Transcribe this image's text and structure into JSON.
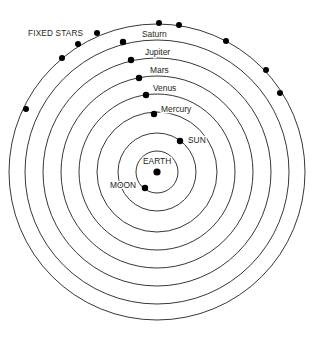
{
  "figure": {
    "background_color": "#ffffff",
    "line_color": "#231f20",
    "dot_color": "#000000",
    "text_color": "#231f20",
    "center": {
      "x": 157,
      "y": 172
    }
  },
  "annotations": {
    "fixed_stars": {
      "label": "FIXED STARS",
      "x": 28,
      "y": 34
    },
    "earth": {
      "label": "EARTH",
      "x": 143,
      "y": 162
    },
    "sun": {
      "label": "SUN",
      "x": 188,
      "y": 141
    },
    "moon": {
      "label": "MOON",
      "x": 110,
      "y": 186
    }
  },
  "orbits": [
    {
      "name": "fixed-stars-sphere",
      "label": "",
      "radius": 148,
      "label_x": null,
      "label_y": null,
      "has_body_dot": false,
      "body_x": null,
      "body_y": null
    },
    {
      "name": "saturn-orbit",
      "label": "Saturn",
      "radius": 132,
      "label_x": 142,
      "label_y": 35,
      "has_body_dot": true,
      "body_x": 123,
      "body_y": 42
    },
    {
      "name": "jupiter-orbit",
      "label": "Jupiter",
      "radius": 114,
      "label_x": 145,
      "label_y": 53,
      "has_body_dot": true,
      "body_x": 131,
      "body_y": 60
    },
    {
      "name": "mars-orbit",
      "label": "Mars",
      "radius": 96,
      "label_x": 150,
      "label_y": 71,
      "has_body_dot": true,
      "body_x": 139,
      "body_y": 78
    },
    {
      "name": "venus-orbit",
      "label": "Venus",
      "radius": 78,
      "label_x": 153,
      "label_y": 89,
      "has_body_dot": true,
      "body_x": 146,
      "body_y": 95
    },
    {
      "name": "mercury-orbit",
      "label": "Mercury",
      "radius": 60,
      "label_x": 161,
      "label_y": 110,
      "has_body_dot": true,
      "body_x": 154,
      "body_y": 114
    },
    {
      "name": "sun-orbit",
      "label": "",
      "radius": 39,
      "label_x": null,
      "label_y": null,
      "has_body_dot": true,
      "body_x": 180,
      "body_y": 141
    },
    {
      "name": "moon-orbit",
      "label": "",
      "radius": 21,
      "label_x": null,
      "label_y": null,
      "has_body_dot": true,
      "body_x": 145,
      "body_y": 188
    }
  ],
  "center_body": {
    "name": "earth",
    "label": "EARTH",
    "x": 157,
    "y": 172,
    "radius": 3.6
  },
  "fixed_stars": [
    {
      "x": 159,
      "y": 23
    },
    {
      "x": 179,
      "y": 25
    },
    {
      "x": 226,
      "y": 41
    },
    {
      "x": 266,
      "y": 70
    },
    {
      "x": 280,
      "y": 93
    },
    {
      "x": 97,
      "y": 33
    },
    {
      "x": 78,
      "y": 44
    },
    {
      "x": 62,
      "y": 58
    },
    {
      "x": 26,
      "y": 109
    }
  ],
  "dot_radii": {
    "planet": 3.2,
    "star": 3.0,
    "earth": 3.6
  }
}
